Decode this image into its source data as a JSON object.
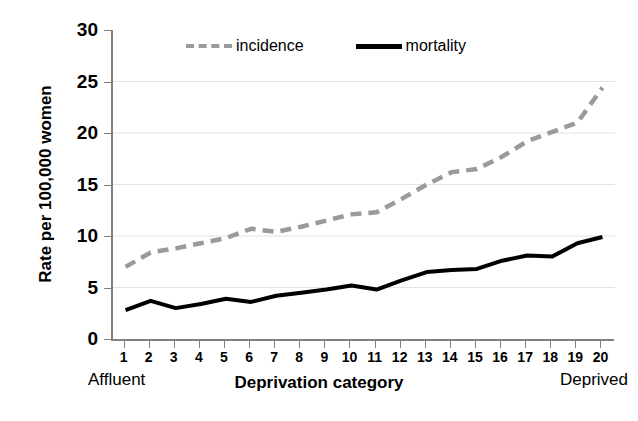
{
  "chart_data": {
    "type": "line",
    "title": "",
    "xlabel": "Deprivation category",
    "ylabel": "Rate per 100,000 women",
    "xlim": [
      1,
      20
    ],
    "ylim": [
      0,
      30
    ],
    "ytick_values": [
      0,
      5,
      10,
      15,
      20,
      25,
      30
    ],
    "ytick_labels": [
      "0",
      "5",
      "10",
      "15",
      "20",
      "25",
      "30"
    ],
    "grid": true,
    "grid_axis": "y",
    "legend_position": "top-center",
    "categories": [
      1,
      2,
      3,
      4,
      5,
      6,
      7,
      8,
      9,
      10,
      11,
      12,
      13,
      14,
      15,
      16,
      17,
      18,
      19,
      20
    ],
    "xtick_labels": [
      "1",
      "2",
      "3",
      "4",
      "5",
      "6",
      "7",
      "8",
      "9",
      "10",
      "11",
      "12",
      "13",
      "14",
      "15",
      "16",
      "17",
      "18",
      "19",
      "20"
    ],
    "x_axis_left_caption": "Affluent",
    "x_axis_right_caption": "Deprived",
    "series": [
      {
        "name": "incidence",
        "style": "dashed",
        "color": "#9a9a9a",
        "values": [
          7.0,
          8.4,
          8.8,
          9.3,
          9.8,
          10.7,
          10.4,
          10.9,
          11.5,
          12.1,
          12.3,
          13.6,
          15.0,
          16.2,
          16.5,
          17.7,
          19.2,
          20.1,
          21.0,
          24.4
        ]
      },
      {
        "name": "mortality",
        "style": "solid",
        "color": "#000000",
        "values": [
          2.8,
          3.7,
          3.0,
          3.4,
          3.9,
          3.6,
          4.2,
          4.5,
          4.8,
          5.2,
          4.8,
          5.7,
          6.5,
          6.7,
          6.8,
          7.6,
          8.1,
          8.0,
          9.3,
          9.9
        ]
      }
    ]
  },
  "legend": {
    "items": [
      {
        "label": "incidence",
        "style": "dashed"
      },
      {
        "label": "mortality",
        "style": "solid"
      }
    ]
  },
  "axes": {
    "y_title": "Rate per 100,000 women",
    "x_title": "Deprivation category",
    "left_caption": "Affluent",
    "right_caption": "Deprived"
  },
  "colors": {
    "incidence": "#9a9a9a",
    "mortality": "#000000",
    "axis": "#808080",
    "grid": "#e2e2e2",
    "background": "#ffffff"
  }
}
